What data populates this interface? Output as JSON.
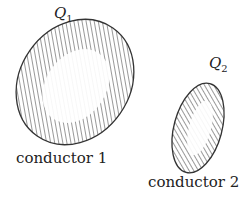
{
  "diagram": {
    "conductors": [
      {
        "charge_symbol": "Q",
        "charge_subscript": "1",
        "caption": "conductor 1"
      },
      {
        "charge_symbol": "Q",
        "charge_subscript": "2",
        "caption": "conductor 2"
      }
    ],
    "colors": {
      "stroke": "#333333",
      "hatch": "#444444",
      "background": "#ffffff"
    }
  }
}
